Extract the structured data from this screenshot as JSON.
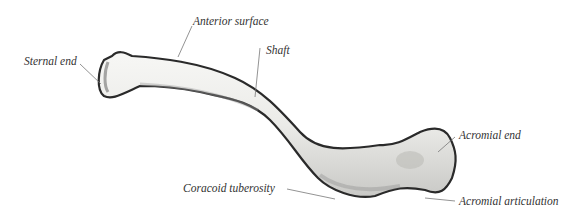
{
  "figure": {
    "labels": {
      "sternal_end": "Sternal end",
      "anterior_surface": "Anterior surface",
      "shaft": "Shaft",
      "acromial_end": "Acromial end",
      "coracoid_tuberosity": "Coracoid tuberosity",
      "acromial_articulation": "Acromial articulation"
    }
  }
}
